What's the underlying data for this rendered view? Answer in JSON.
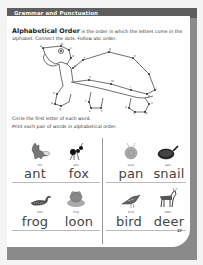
{
  "header": {
    "title": "Grammar and Punctuation"
  },
  "intro": {
    "term": "Alphabetical Order",
    "definition": " is the order in which the letters come in the alphabet. Connect the dots. Follow abc order."
  },
  "activity": {
    "picture": "turtle-connect-the-dots",
    "dot_labels": [
      "a",
      "b",
      "c",
      "d",
      "e",
      "f",
      "g",
      "h",
      "i",
      "j",
      "k",
      "l",
      "m",
      "n",
      "o",
      "p",
      "q",
      "r",
      "s",
      "t",
      "u",
      "v",
      "w",
      "x",
      "y",
      "z"
    ]
  },
  "instructions": [
    "Circle the first letter of each word.",
    "Print each pair of words in alphabetical order."
  ],
  "pairs": [
    {
      "pictures": [
        {
          "icon": "fox-icon",
          "label": "fox"
        },
        {
          "icon": "ant-icon",
          "label": "ant"
        }
      ],
      "answers": [
        "ant",
        "fox"
      ]
    },
    {
      "pictures": [
        {
          "icon": "snail-icon",
          "label": "snail"
        },
        {
          "icon": "pan-icon",
          "label": "pan"
        }
      ],
      "answers": [
        "pan",
        "snail"
      ]
    },
    {
      "pictures": [
        {
          "icon": "loon-icon",
          "label": "loon"
        },
        {
          "icon": "frog-icon",
          "label": "frog"
        }
      ],
      "answers": [
        "frog",
        "loon"
      ]
    },
    {
      "pictures": [
        {
          "icon": "bird-icon",
          "label": "bird"
        },
        {
          "icon": "deer-icon",
          "label": "deer"
        }
      ],
      "answers": [
        "bird",
        "deer"
      ]
    }
  ],
  "footer": {
    "page_number": "27"
  },
  "colors": {
    "header_band": "#5e5e5e",
    "frame": "#8a8a8a",
    "text": "#333333"
  }
}
